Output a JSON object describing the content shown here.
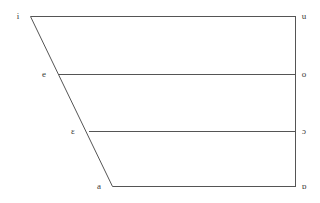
{
  "chart_data": {
    "type": "scatter",
    "title": "",
    "subtitle": "",
    "xlabel": "",
    "ylabel": "",
    "grid": false,
    "legend": null,
    "axis_ranges": {
      "x": [
        0,
        100
      ],
      "y": [
        0,
        100
      ]
    },
    "outline": {
      "name": "vowel-trapezium",
      "stroke": "#555555",
      "stroke_width": 1,
      "fill": "none",
      "vertices": [
        {
          "name": "close-front",
          "x": 30,
          "y": 16
        },
        {
          "name": "close-back",
          "x": 295,
          "y": 16
        },
        {
          "name": "open-back",
          "x": 295,
          "y": 186
        },
        {
          "name": "open-front",
          "x": 112,
          "y": 186
        }
      ]
    },
    "height_lines": [
      {
        "name": "close-line",
        "height": "close",
        "y": 16,
        "x_start": 30,
        "x_end": 295
      },
      {
        "name": "close-mid-line",
        "height": "close-mid",
        "y": 74,
        "x_start": 58,
        "x_end": 295
      },
      {
        "name": "open-mid-line",
        "height": "open-mid",
        "y": 131,
        "x_start": 88,
        "x_end": 295
      },
      {
        "name": "open-line",
        "height": "open",
        "y": 186,
        "x_start": 112,
        "x_end": 295
      }
    ],
    "rows": [
      {
        "height": "close",
        "y": 16,
        "front": {
          "symbol": "i",
          "x": 18,
          "y": 16
        },
        "back": {
          "symbol": "u",
          "x": 304,
          "y": 16
        }
      },
      {
        "height": "close-mid",
        "y": 74,
        "front": {
          "symbol": "e",
          "x": 44,
          "y": 74
        },
        "back": {
          "symbol": "o",
          "x": 304,
          "y": 74
        }
      },
      {
        "height": "open-mid",
        "y": 131,
        "front": {
          "symbol": "ɛ",
          "x": 73,
          "y": 131
        },
        "back": {
          "symbol": "ɔ",
          "x": 304,
          "y": 131
        }
      },
      {
        "height": "open",
        "y": 186,
        "front": {
          "symbol": "a",
          "x": 99,
          "y": 186
        },
        "back": {
          "symbol": "ɒ",
          "x": 304,
          "y": 186
        }
      }
    ],
    "front_symbols": [
      "i",
      "e",
      "ɛ",
      "a"
    ],
    "back_symbols": [
      "u",
      "o",
      "ɔ",
      "ɒ"
    ],
    "colors": {
      "background": "#ffffff",
      "line": "#555555",
      "text": "#3a3a3a"
    }
  }
}
